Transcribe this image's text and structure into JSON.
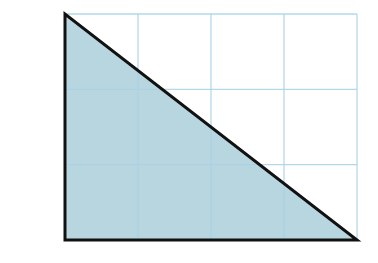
{
  "diagram": {
    "type": "grid-triangle",
    "grid": {
      "columns": 4,
      "rows": 3,
      "x0": 65,
      "y0": 14,
      "x1": 357,
      "y1": 240,
      "line_color": "#a9d2e6"
    },
    "triangle": {
      "vertices": [
        [
          65,
          14
        ],
        [
          65,
          240
        ],
        [
          357,
          240
        ]
      ],
      "fill": "#b7d6df",
      "stroke": "#111111",
      "description": "Right triangle with legs 4 units (base) and 3 units (height) on a 4x3 unit grid"
    },
    "base_units": 4,
    "height_units": 3
  }
}
